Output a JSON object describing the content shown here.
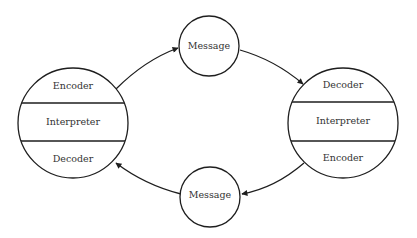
{
  "diagram": {
    "type": "communication-cycle",
    "colors": {
      "line": "#1e1e1e",
      "text": "#333333",
      "background": "#ffffff"
    },
    "nodes": [
      {
        "id": "left-party",
        "sections": [
          "Encoder",
          "Interpreter",
          "Decoder"
        ]
      },
      {
        "id": "right-party",
        "sections": [
          "Decoder",
          "Interpreter",
          "Encoder"
        ]
      },
      {
        "id": "top-message",
        "label": "Message"
      },
      {
        "id": "bottom-message",
        "label": "Message"
      }
    ],
    "edges": [
      {
        "from": "left-party",
        "to": "top-message"
      },
      {
        "from": "top-message",
        "to": "right-party"
      },
      {
        "from": "right-party",
        "to": "bottom-message"
      },
      {
        "from": "bottom-message",
        "to": "left-party"
      }
    ]
  },
  "left": {
    "top": "Encoder",
    "middle": "Interpreter",
    "bottom": "Decoder"
  },
  "right": {
    "top": "Decoder",
    "middle": "Interpreter",
    "bottom": "Encoder"
  },
  "top_message": {
    "label": "Message"
  },
  "bottom_message": {
    "label": "Message"
  }
}
